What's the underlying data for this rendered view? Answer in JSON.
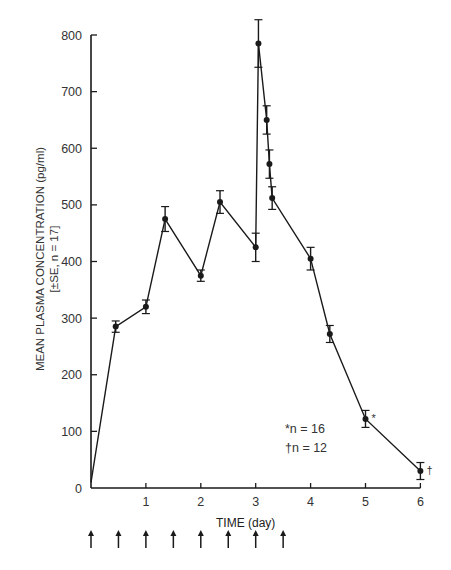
{
  "chart_data": {
    "type": "line",
    "title": "",
    "xlabel": "TIME (day)",
    "ylabel": "MEAN PLASMA CONCENTRATION (pg/ml)",
    "ylabel2": "[±SE, n = 17]",
    "xlim": [
      0,
      6
    ],
    "ylim": [
      0,
      800
    ],
    "xticks": [
      1,
      2,
      3,
      4,
      5,
      6
    ],
    "yticks": [
      0,
      100,
      200,
      300,
      400,
      500,
      600,
      700,
      800
    ],
    "grid": false,
    "series": [
      {
        "name": "Mean plasma concentration",
        "x": [
          0,
          0.45,
          1.0,
          1.35,
          2.0,
          2.35,
          3.0,
          3.05,
          3.2,
          3.25,
          3.3,
          4.0,
          4.35,
          5.0,
          6.0
        ],
        "y": [
          10,
          285,
          320,
          475,
          375,
          505,
          425,
          785,
          650,
          572,
          512,
          405,
          272,
          122,
          30
        ],
        "se": [
          0,
          10,
          12,
          22,
          10,
          20,
          25,
          42,
          25,
          25,
          20,
          20,
          15,
          15,
          15
        ],
        "markers": [
          "",
          "",
          "",
          "",
          "",
          "",
          "",
          "",
          "",
          "",
          "",
          "",
          "",
          "*",
          "†"
        ]
      }
    ],
    "dose_arrows_x": [
      0,
      0.5,
      1.0,
      1.5,
      2.0,
      2.5,
      3.0,
      3.5
    ],
    "annotations": [
      "*n = 16",
      "†n = 12"
    ]
  },
  "legend": {
    "line1": "*n = 16",
    "line2": "†n = 12"
  }
}
